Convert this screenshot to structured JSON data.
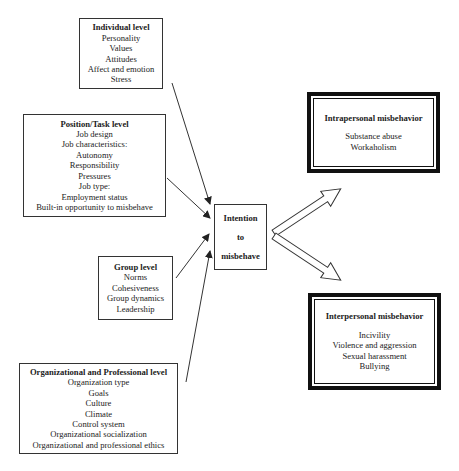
{
  "levels": {
    "individual": {
      "title": "Individual level",
      "items": [
        "Personality",
        "Values",
        "Attitudes",
        "Affect and emotion",
        "Stress"
      ]
    },
    "position": {
      "title": "Position/Task level",
      "items": [
        "Job design",
        "Job characteristics:",
        "Autonomy",
        "Responsibility",
        "Pressures",
        "Job type:",
        "Employment status",
        "Built-in opportunity to misbehave"
      ]
    },
    "group": {
      "title": "Group level",
      "items": [
        "Norms",
        "Cohesiveness",
        "Group dynamics",
        "Leadership"
      ]
    },
    "organizational": {
      "title": "Organizational and Professional level",
      "items": [
        "Organization type",
        "Goals",
        "Culture",
        "Climate",
        "Control system",
        "Organizational socialization",
        "Organizational and professional ethics"
      ]
    }
  },
  "center": {
    "lines": [
      "Intention",
      "to",
      "misbehave"
    ]
  },
  "outcomes": {
    "intrapersonal": {
      "title": "Intrapersonal misbehavior",
      "items": [
        "Substance abuse",
        "Workaholism"
      ]
    },
    "interpersonal": {
      "title": "Interpersonal misbehavior",
      "items": [
        "Incivility",
        "Violence and aggression",
        "Sexual harassment",
        "Bullying"
      ]
    }
  }
}
